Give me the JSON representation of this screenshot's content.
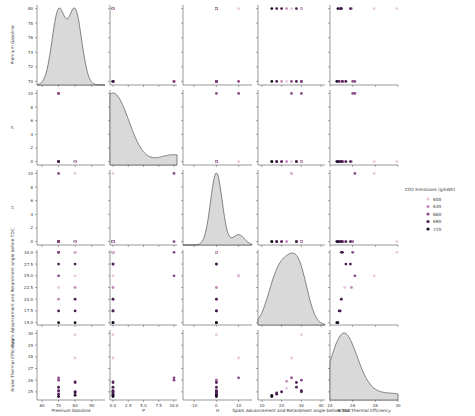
{
  "chart_data": {
    "type": "scatter",
    "subtype": "pairplot",
    "variables": [
      "Premium Gasoline",
      "P",
      "H",
      "Spark Advancement and Retardment angle before TDC",
      "Brake Thermal Efficiency"
    ],
    "hue": "CO2 Emissions (g/kWh)",
    "legend": {
      "title": "CO2 Emissions (g/kWh)",
      "entries": [
        "600",
        "630",
        "660",
        "690",
        "720"
      ],
      "position": "right"
    },
    "axes": {
      "Premium Gasoline": {
        "lim": [
          57,
          98
        ],
        "ticks": [
          60,
          70,
          80,
          90
        ],
        "ylim": [
          69.5,
          80.5
        ],
        "yticks": [
          70,
          72,
          74,
          76,
          78,
          80
        ]
      },
      "P": {
        "lim": [
          -0.5,
          10.5
        ],
        "ticks": [
          0.0,
          2.5,
          5.0,
          7.5,
          10.0
        ],
        "ticklabels": [
          "0.0",
          "2.5",
          "5.0",
          "7.5",
          "10.0"
        ],
        "yticks": [
          0,
          2,
          4,
          6,
          8,
          10
        ]
      },
      "H": {
        "lim": [
          -15,
          16
        ],
        "ticks": [
          -10,
          0,
          10
        ],
        "yticks": [
          0,
          2,
          4,
          6,
          8,
          10
        ]
      },
      "Spark Advancement and Retardment angle before TDC": {
        "lim": [
          8,
          42
        ],
        "ticks": [
          10,
          20,
          30,
          40
        ],
        "ylim": [
          14.5,
          30.5
        ],
        "yticks": [
          15.0,
          17.5,
          20.0,
          22.5,
          25.0,
          27.5,
          30.0
        ]
      },
      "Brake Thermal Efficiency": {
        "lim": [
          24,
          30
        ],
        "ticks": [
          24,
          26,
          28,
          30
        ],
        "ylim": [
          24.3,
          30.3
        ],
        "yticks": [
          25,
          26,
          27,
          28,
          29,
          30
        ]
      }
    },
    "observations": [
      {
        "pg": 70,
        "p": 0,
        "h": 0,
        "spark": 15.0,
        "bte": 24.6,
        "co2": 720
      },
      {
        "pg": 70,
        "p": 0,
        "h": 0,
        "spark": 17.5,
        "bte": 24.8,
        "co2": 690
      },
      {
        "pg": 70,
        "p": 0,
        "h": 0,
        "spark": 20.0,
        "bte": 25.0,
        "co2": 630
      },
      {
        "pg": 70,
        "p": 0,
        "h": 0,
        "spark": 22.5,
        "bte": 25.3,
        "co2": 600
      },
      {
        "pg": 70,
        "p": 0,
        "h": 0,
        "spark": 27.5,
        "bte": 25.4,
        "co2": 690
      },
      {
        "pg": 70,
        "p": 0,
        "h": 0,
        "spark": 30.0,
        "bte": 25.1,
        "co2": 690
      },
      {
        "pg": 70,
        "p": 10,
        "h": 10,
        "spark": 25.0,
        "bte": 26.2,
        "co2": 660
      },
      {
        "pg": 70,
        "p": 10,
        "h": 0,
        "spark": 30.0,
        "bte": 26.0,
        "co2": 660
      },
      {
        "pg": 80,
        "p": 0,
        "h": 0,
        "spark": 15.0,
        "bte": 24.7,
        "co2": 720
      },
      {
        "pg": 80,
        "p": 0,
        "h": 0,
        "spark": 17.5,
        "bte": 24.9,
        "co2": 690
      },
      {
        "pg": 80,
        "p": 0,
        "h": 0,
        "spark": 20.0,
        "bte": 25.0,
        "co2": 690
      },
      {
        "pg": 80,
        "p": 0,
        "h": 0,
        "spark": 22.5,
        "bte": 25.9,
        "co2": 630
      },
      {
        "pg": 80,
        "p": 0,
        "h": 10,
        "spark": 25.0,
        "bte": 27.9,
        "co2": 600
      },
      {
        "pg": 80,
        "p": 0,
        "h": 0,
        "spark": 27.5,
        "bte": 25.8,
        "co2": 690
      },
      {
        "pg": 80,
        "p": 0,
        "h": 0,
        "spark": 30.0,
        "bte": 25.0,
        "co2": 690
      },
      {
        "pg": 80,
        "p": 0,
        "h": 0,
        "spark": 30.0,
        "bte": 29.9,
        "co2": 600
      }
    ]
  },
  "labels": {
    "x": [
      "Premium Gasoline",
      "P",
      "H",
      "Spark Advancement and Retardment angle before TDC",
      "Brake Thermal Efficiency"
    ],
    "y": [
      "Premium Gasoline",
      "P",
      "H",
      "Spark Advancement and Retardment angle before TDC",
      "Brake Thermal Efficiency"
    ]
  }
}
